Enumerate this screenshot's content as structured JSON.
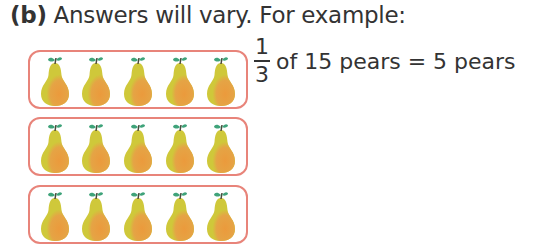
{
  "heading": {
    "label": "(b)",
    "text": " Answers will vary. For example:"
  },
  "equation": {
    "numerator": "1",
    "denominator": "3",
    "text": "of 15 pears = 5 pears"
  },
  "groups": [
    {
      "count": 5,
      "item": "pear"
    },
    {
      "count": 5,
      "item": "pear"
    },
    {
      "count": 5,
      "item": "pear"
    }
  ],
  "colors": {
    "group_border": "#e8847a",
    "pear_body": "#d4c93a",
    "pear_blush": "#eb9a3c",
    "leaf": "#3fa37a",
    "stem": "#4a4a3a",
    "text": "#333333"
  }
}
